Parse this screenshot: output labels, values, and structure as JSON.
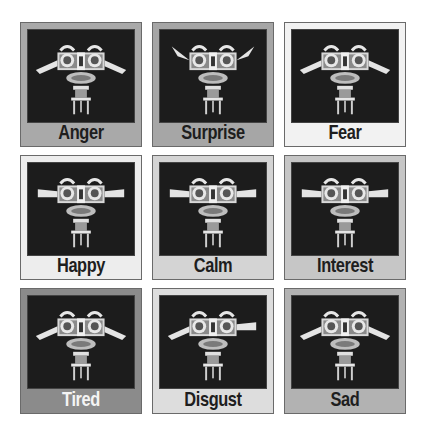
{
  "figure": {
    "panels": [
      {
        "label": "Anger",
        "bg": "#a9a9a9",
        "label_color": "#1e1e1e",
        "ears": "down"
      },
      {
        "label": "Surprise",
        "bg": "#a6a6a6",
        "label_color": "#1e1e1e",
        "ears": "up"
      },
      {
        "label": "Fear",
        "bg": "#f2f2f2",
        "label_color": "#1e1e1e",
        "ears": "down"
      },
      {
        "label": "Happy",
        "bg": "#ededed",
        "label_color": "#1e1e1e",
        "ears": "level"
      },
      {
        "label": "Calm",
        "bg": "#d4d4d4",
        "label_color": "#1e1e1e",
        "ears": "level"
      },
      {
        "label": "Interest",
        "bg": "#c6c6c6",
        "label_color": "#1e1e1e",
        "ears": "level"
      },
      {
        "label": "Tired",
        "bg": "#8b8b8b",
        "label_color": "#f4f4f4",
        "ears": "down"
      },
      {
        "label": "Disgust",
        "bg": "#dddddd",
        "label_color": "#1e1e1e",
        "ears": "mixed"
      },
      {
        "label": "Sad",
        "bg": "#b2b2b2",
        "label_color": "#1e1e1e",
        "ears": "down"
      }
    ]
  }
}
